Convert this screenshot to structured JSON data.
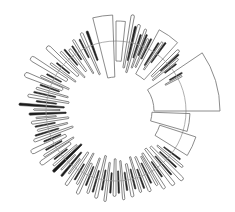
{
  "chart_data": {
    "type": "radial-bar",
    "title": "",
    "xlabel": "",
    "ylabel": "",
    "grid": false,
    "legend": null,
    "center": [
      116,
      111
    ],
    "baseline_radius": 70,
    "colors": {
      "ring": "#9a9a9a",
      "outline": "#333333",
      "fill": "#1a1a1a",
      "big_outline": "#6e6e6e"
    },
    "big_wedges": [
      {
        "start": -34,
        "end": 0,
        "r0": 38,
        "r1": 104
      },
      {
        "start": 2,
        "end": 16,
        "r0": 36,
        "r1": 74
      },
      {
        "start": 18,
        "end": 32,
        "r0": 46,
        "r1": 84
      },
      {
        "start": -62,
        "end": -48,
        "r0": 42,
        "r1": 92
      },
      {
        "start": -104,
        "end": -92,
        "r0": 34,
        "r1": 96
      },
      {
        "start": -90,
        "end": -84,
        "r0": 50,
        "r1": 90
      }
    ],
    "bars": [
      [
        -80,
        2,
        44,
        96,
        0
      ],
      [
        -77,
        1.2,
        52,
        86,
        1
      ],
      [
        -75,
        2,
        40,
        88,
        0
      ],
      [
        -72,
        1,
        56,
        80,
        1
      ],
      [
        -70,
        1.5,
        46,
        86,
        0
      ],
      [
        -68,
        1,
        60,
        82,
        1
      ],
      [
        -66,
        1.5,
        48,
        78,
        0
      ],
      [
        -64,
        1,
        58,
        80,
        1
      ],
      [
        -44,
        2,
        50,
        86,
        0
      ],
      [
        -42,
        1,
        60,
        84,
        1
      ],
      [
        -40,
        1.5,
        48,
        80,
        0
      ],
      [
        -38,
        1,
        62,
        76,
        1
      ],
      [
        -110,
        1.5,
        54,
        84,
        1
      ],
      [
        -114,
        2,
        40,
        84,
        0
      ],
      [
        -117,
        1,
        60,
        80,
        1
      ],
      [
        -121,
        1.5,
        44,
        82,
        0
      ],
      [
        -124,
        1,
        62,
        78,
        1
      ],
      [
        -127,
        2,
        50,
        76,
        0
      ],
      [
        -130,
        1,
        60,
        80,
        1
      ],
      [
        -133,
        1.5,
        46,
        80,
        0
      ],
      [
        -137,
        3,
        52,
        92,
        0
      ],
      [
        -141,
        1,
        60,
        76,
        1
      ],
      [
        -144,
        1.5,
        50,
        80,
        0
      ],
      [
        -148,
        3,
        58,
        98,
        0
      ],
      [
        -152,
        1,
        62,
        78,
        1
      ],
      [
        -155,
        1.5,
        52,
        82,
        0
      ],
      [
        -158,
        3,
        58,
        96,
        0
      ],
      [
        -161,
        1,
        60,
        80,
        1
      ],
      [
        -164,
        1.5,
        50,
        82,
        0
      ],
      [
        -167,
        1,
        62,
        84,
        1
      ],
      [
        -170,
        2,
        48,
        88,
        0
      ],
      [
        -173,
        1,
        60,
        80,
        1
      ],
      [
        -176,
        1.5,
        52,
        96,
        1
      ],
      [
        -179,
        1,
        56,
        82,
        0
      ],
      [
        178,
        1.5,
        50,
        86,
        1
      ],
      [
        175,
        1,
        60,
        80,
        0
      ],
      [
        172,
        2,
        48,
        84,
        0
      ],
      [
        169,
        1,
        62,
        82,
        1
      ],
      [
        166,
        1.5,
        50,
        80,
        0
      ],
      [
        163,
        1,
        60,
        84,
        1
      ],
      [
        160,
        2,
        46,
        86,
        0
      ],
      [
        157,
        1,
        60,
        78,
        1
      ],
      [
        154,
        3,
        56,
        92,
        0
      ],
      [
        151,
        1,
        62,
        80,
        1
      ],
      [
        148,
        1.5,
        50,
        84,
        0
      ],
      [
        145,
        3,
        56,
        90,
        0
      ],
      [
        142,
        1,
        62,
        78,
        1
      ],
      [
        139,
        1.5,
        52,
        82,
        0
      ],
      [
        136,
        2,
        48,
        86,
        1
      ],
      [
        133,
        1,
        60,
        80,
        0
      ],
      [
        130,
        1.5,
        54,
        84,
        1
      ],
      [
        127,
        1,
        60,
        78,
        0
      ],
      [
        124,
        2,
        50,
        88,
        0
      ],
      [
        121,
        1,
        62,
        80,
        1
      ],
      [
        118,
        1.5,
        48,
        82,
        0
      ],
      [
        115,
        2,
        58,
        90,
        0
      ],
      [
        112,
        1,
        60,
        80,
        1
      ],
      [
        109,
        1.5,
        50,
        86,
        0
      ],
      [
        106,
        1,
        62,
        84,
        1
      ],
      [
        103,
        2,
        46,
        88,
        0
      ],
      [
        100,
        1,
        60,
        80,
        1
      ],
      [
        97,
        1.5,
        52,
        90,
        0
      ],
      [
        94,
        1,
        62,
        82,
        1
      ],
      [
        91,
        2,
        48,
        84,
        0
      ],
      [
        88,
        1,
        60,
        82,
        1
      ],
      [
        85,
        1.5,
        50,
        88,
        0
      ],
      [
        82,
        1,
        62,
        80,
        1
      ],
      [
        79,
        2,
        54,
        86,
        0
      ],
      [
        76,
        1,
        60,
        80,
        1
      ],
      [
        73,
        1.5,
        48,
        84,
        0
      ],
      [
        70,
        1,
        62,
        82,
        1
      ],
      [
        67,
        2,
        50,
        86,
        0
      ],
      [
        64,
        1,
        58,
        80,
        1
      ],
      [
        61,
        1.5,
        52,
        84,
        0
      ],
      [
        58,
        2,
        50,
        90,
        0
      ],
      [
        55,
        1,
        62,
        80,
        1
      ],
      [
        52,
        2.5,
        48,
        92,
        0
      ],
      [
        49,
        1,
        60,
        84,
        1
      ],
      [
        46,
        2.5,
        50,
        94,
        0
      ],
      [
        43,
        1,
        60,
        82,
        1
      ],
      [
        40,
        1.5,
        54,
        86,
        0
      ],
      [
        37,
        1,
        60,
        80,
        1
      ],
      [
        -58,
        1,
        54,
        80,
        1
      ],
      [
        -56,
        1.5,
        50,
        82,
        0
      ],
      [
        -54,
        1,
        60,
        84,
        1
      ],
      [
        -30,
        1,
        62,
        76,
        1
      ],
      [
        -28,
        1.2,
        56,
        74,
        0
      ]
    ]
  }
}
